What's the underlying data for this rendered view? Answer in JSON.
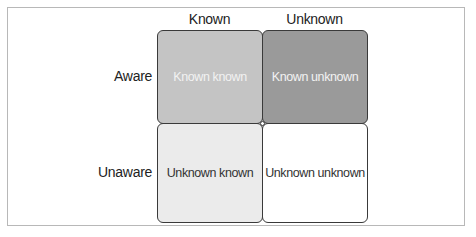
{
  "diagram": {
    "columns": [
      {
        "label": "Known"
      },
      {
        "label": "Unknown"
      }
    ],
    "rows": [
      {
        "label": "Aware"
      },
      {
        "label": "Unaware"
      }
    ],
    "cells": [
      {
        "label": "Known known",
        "fill": "#c4c4c4",
        "text_color": "#f2f2f2"
      },
      {
        "label": "Known unknown",
        "fill": "#9a9a9a",
        "text_color": "#f2f2f2"
      },
      {
        "label": "Unknown known",
        "fill": "#ebebeb",
        "text_color": "#333333"
      },
      {
        "label": "Unknown unknown",
        "fill": "#ffffff",
        "text_color": "#333333"
      }
    ]
  }
}
